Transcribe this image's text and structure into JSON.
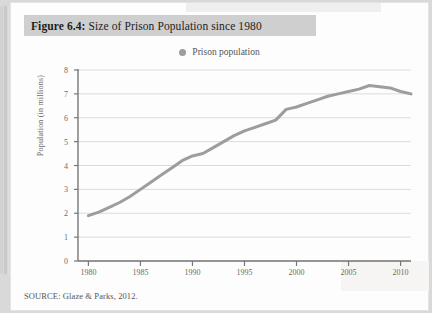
{
  "figure": {
    "label": "Figure 6.4:",
    "title": " Size of Prison Population since 1980",
    "full_title": "Figure 6.4: Size of Prison Population since 1980",
    "source": "SOURCE: Glaze & Parks, 2012.",
    "title_band_color": "#cfcfcf",
    "page_color": "#fdfdfd"
  },
  "chart_data": {
    "type": "line",
    "title": "Size of Prison Population since 1980",
    "xlabel": "",
    "ylabel": "Population (in millions)",
    "xlim": [
      1979,
      2011
    ],
    "ylim": [
      0,
      8
    ],
    "xticks": [
      1980,
      1985,
      1990,
      1995,
      2000,
      2005,
      2010
    ],
    "yticks": [
      0,
      1,
      2,
      3,
      4,
      5,
      6,
      7,
      8
    ],
    "grid": "horizontal",
    "legend": {
      "position": "top-center",
      "entries": [
        "Prison population"
      ]
    },
    "series": [
      {
        "name": "Prison population",
        "color": "#9d9d9d",
        "marker": "none",
        "linewidth": 3,
        "x": [
          1980,
          1981,
          1982,
          1983,
          1984,
          1985,
          1986,
          1987,
          1988,
          1989,
          1990,
          1991,
          1992,
          1993,
          1994,
          1995,
          1996,
          1997,
          1998,
          1999,
          2000,
          2001,
          2002,
          2003,
          2004,
          2005,
          2006,
          2007,
          2008,
          2009,
          2010,
          2011
        ],
        "y": [
          1.9,
          2.05,
          2.25,
          2.45,
          2.7,
          3.0,
          3.3,
          3.6,
          3.9,
          4.2,
          4.4,
          4.5,
          4.75,
          5.0,
          5.25,
          5.45,
          5.6,
          5.75,
          5.9,
          6.35,
          6.45,
          6.6,
          6.75,
          6.9,
          7.0,
          7.1,
          7.2,
          7.35,
          7.3,
          7.25,
          7.1,
          7.0
        ]
      }
    ]
  }
}
